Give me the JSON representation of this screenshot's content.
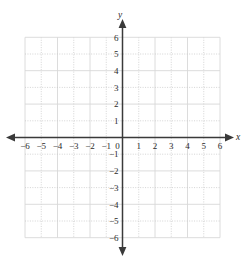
{
  "figure": {
    "kind": "cartesian-coordinate-grid",
    "title": "",
    "background_color": "#ffffff",
    "axis_color": "#3a3a3a",
    "grid_color": "#c9c9c9",
    "label_color": "#2b2b2b"
  },
  "chart_data": {
    "type": "scatter",
    "title": "",
    "xlabel": "x",
    "ylabel": "y",
    "xlim": [
      -6,
      6
    ],
    "ylim": [
      -6,
      6
    ],
    "xticks": [
      -6,
      -5,
      -4,
      -3,
      -2,
      -1,
      0,
      1,
      2,
      3,
      4,
      5,
      6
    ],
    "yticks": [
      -6,
      -5,
      -4,
      -3,
      -2,
      -1,
      1,
      2,
      3,
      4,
      5,
      6
    ],
    "xtick_labels": [
      "−6",
      "−5",
      "−4",
      "−3",
      "−2",
      "−1",
      "0",
      "1",
      "2",
      "3",
      "4",
      "5",
      "6"
    ],
    "ytick_labels": [
      "−6",
      "−5",
      "−4",
      "−3",
      "−2",
      "−1",
      "1",
      "2",
      "3",
      "4",
      "5",
      "6"
    ],
    "grid": true,
    "grid_style": "dotted",
    "legend": null,
    "series": [],
    "annotations": [],
    "origin_label": "0",
    "arrows": [
      "x-positive",
      "x-negative",
      "y-positive",
      "y-negative"
    ]
  },
  "axes": {
    "x_axis_name": "x",
    "y_axis_name": "y"
  }
}
